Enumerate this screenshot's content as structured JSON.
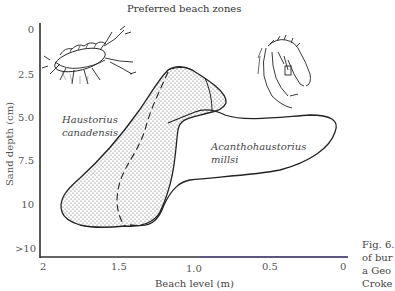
{
  "figure": {
    "title": "Preferred beach zones",
    "y_axis": {
      "label": "Sand depth (cm)",
      "ticks": [
        "0",
        "2.5",
        "5.0",
        "7.5",
        "10",
        ">10"
      ]
    },
    "x_axis": {
      "label": "Beach level (m)",
      "ticks": [
        "2",
        "1.5",
        "1.0",
        "0.5",
        "0"
      ]
    },
    "species": [
      {
        "name_line1": "Haustorius",
        "name_line2": "canadensis",
        "zone_style": "stippled-fill"
      },
      {
        "name_line1": "Acanthohaustorius",
        "name_line2": "millsi",
        "zone_style": "outline"
      }
    ],
    "illustrations": [
      "amphipod-haustorius-drawing",
      "amphipod-acanthohaustorius-drawing"
    ],
    "caption_fragment": [
      "Fig. 6.",
      "of bur",
      "a Geo",
      "Croke"
    ],
    "colors": {
      "line": "#222222",
      "axis": "#222222",
      "stipple": "#555555",
      "text": "#444444"
    }
  }
}
